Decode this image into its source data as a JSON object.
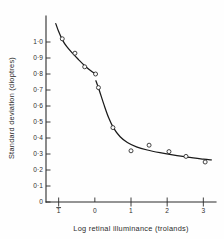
{
  "figure": {
    "background_color": "#fefefe",
    "ink_color": "#1a1a1a"
  },
  "chart_data": {
    "type": "scatter",
    "title": "",
    "subtitle": "",
    "xlabel": "Log retinal illuminance (trolands)",
    "ylabel": "Standard deviation (dioptres)",
    "xlim": [
      -1.35,
      3.35
    ],
    "ylim": [
      0,
      1.12
    ],
    "grid": false,
    "legend": null,
    "x_ticks": [
      -1,
      0,
      1,
      2,
      3
    ],
    "x_tick_labels": [
      "1",
      "0",
      "1",
      "2",
      "3"
    ],
    "x_tick_label_negative_flags": [
      true,
      false,
      false,
      false,
      false
    ],
    "y_ticks": [
      0,
      0.1,
      0.2,
      0.3,
      0.4,
      0.5,
      0.6,
      0.7,
      0.8,
      0.9,
      1.0
    ],
    "y_tick_labels": [
      "0",
      "0·1",
      "0·2",
      "0·3",
      "0·4",
      "0·5",
      "0·6",
      "0·7",
      "0·8",
      "0·9",
      "1·0"
    ],
    "marker": "open-circle",
    "points": [
      {
        "x": -0.9,
        "y": 1.02
      },
      {
        "x": -0.55,
        "y": 0.93
      },
      {
        "x": -0.28,
        "y": 0.845
      },
      {
        "x": 0.02,
        "y": 0.8
      },
      {
        "x": 0.1,
        "y": 0.715
      },
      {
        "x": 0.5,
        "y": 0.465
      },
      {
        "x": 1.0,
        "y": 0.32
      },
      {
        "x": 1.5,
        "y": 0.355
      },
      {
        "x": 2.05,
        "y": 0.315
      },
      {
        "x": 2.52,
        "y": 0.285
      },
      {
        "x": 3.05,
        "y": 0.25
      }
    ],
    "fitted_curve_segment_1": [
      {
        "x": -1.08,
        "y": 1.115
      },
      {
        "x": -1.0,
        "y": 1.065
      },
      {
        "x": -0.9,
        "y": 1.015
      },
      {
        "x": -0.78,
        "y": 0.972
      },
      {
        "x": -0.62,
        "y": 0.93
      },
      {
        "x": -0.45,
        "y": 0.89
      },
      {
        "x": -0.28,
        "y": 0.852
      },
      {
        "x": -0.12,
        "y": 0.822
      },
      {
        "x": 0.02,
        "y": 0.8
      }
    ],
    "fitted_curve_segment_2": [
      {
        "x": 0.03,
        "y": 0.758
      },
      {
        "x": 0.12,
        "y": 0.7
      },
      {
        "x": 0.25,
        "y": 0.61
      },
      {
        "x": 0.38,
        "y": 0.528
      },
      {
        "x": 0.52,
        "y": 0.462
      },
      {
        "x": 0.7,
        "y": 0.408
      },
      {
        "x": 0.9,
        "y": 0.372
      },
      {
        "x": 1.15,
        "y": 0.345
      },
      {
        "x": 1.45,
        "y": 0.325
      },
      {
        "x": 1.8,
        "y": 0.308
      },
      {
        "x": 2.15,
        "y": 0.294
      },
      {
        "x": 2.55,
        "y": 0.28
      },
      {
        "x": 3.0,
        "y": 0.268
      },
      {
        "x": 3.22,
        "y": 0.263
      }
    ]
  }
}
